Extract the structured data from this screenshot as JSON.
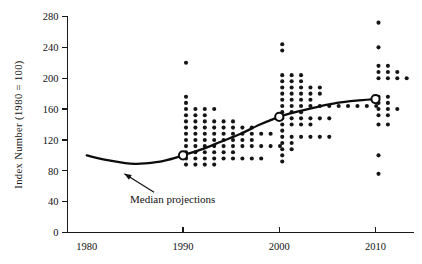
{
  "chart_data": {
    "type": "scatter",
    "title": "",
    "xlabel": "",
    "ylabel": "Index  Number  (1980 = 100)",
    "xlim": [
      1978,
      2014
    ],
    "ylim": [
      0,
      280
    ],
    "xticks": [
      1980,
      1990,
      2000,
      2010
    ],
    "yticks": [
      0,
      40,
      80,
      120,
      160,
      200,
      240,
      280
    ],
    "grid": false,
    "legend": "none",
    "annotations": [
      {
        "text": "Median projections",
        "x": 1984.5,
        "y": 38,
        "arrow_to_x": 1983.6,
        "arrow_to_y": 84
      }
    ],
    "series": [
      {
        "name": "Median projections",
        "type": "line",
        "marker": "open-circle-at-survey-years",
        "x": [
          1980,
          1982,
          1984,
          1985,
          1986,
          1988,
          1990,
          1992,
          1994,
          1996,
          1998,
          2000,
          2002,
          2004,
          2006,
          2008,
          2010
        ],
        "y": [
          100,
          94,
          90,
          89,
          89.5,
          93,
          100,
          108,
          118,
          128,
          140,
          150,
          157,
          163,
          168,
          171,
          173
        ],
        "marker_x": [
          1990,
          2000,
          2010
        ],
        "marker_y": [
          100,
          150,
          173
        ]
      },
      {
        "name": "Individual projections 1990",
        "type": "dotplot",
        "year": 1990,
        "bins": [
          {
            "value": 220,
            "count": 1
          },
          {
            "value": 176,
            "count": 1
          },
          {
            "value": 168,
            "count": 1
          },
          {
            "value": 160,
            "count": 4
          },
          {
            "value": 152,
            "count": 3
          },
          {
            "value": 144,
            "count": 6
          },
          {
            "value": 136,
            "count": 8
          },
          {
            "value": 128,
            "count": 10
          },
          {
            "value": 120,
            "count": 8
          },
          {
            "value": 112,
            "count": 11
          },
          {
            "value": 104,
            "count": 6
          },
          {
            "value": 96,
            "count": 9
          },
          {
            "value": 88,
            "count": 4
          }
        ]
      },
      {
        "name": "Individual projections 2000",
        "type": "dotplot",
        "year": 2000,
        "bins": [
          {
            "value": 244,
            "count": 1
          },
          {
            "value": 236,
            "count": 1
          },
          {
            "value": 204,
            "count": 3
          },
          {
            "value": 196,
            "count": 3
          },
          {
            "value": 188,
            "count": 5
          },
          {
            "value": 180,
            "count": 5
          },
          {
            "value": 172,
            "count": 4
          },
          {
            "value": 164,
            "count": 11
          },
          {
            "value": 156,
            "count": 3
          },
          {
            "value": 148,
            "count": 6
          },
          {
            "value": 140,
            "count": 4
          },
          {
            "value": 132,
            "count": 1
          },
          {
            "value": 124,
            "count": 6
          },
          {
            "value": 116,
            "count": 2
          },
          {
            "value": 108,
            "count": 2
          },
          {
            "value": 100,
            "count": 1
          },
          {
            "value": 92,
            "count": 1
          }
        ]
      },
      {
        "name": "Individual projections 2010",
        "type": "dotplot",
        "year": 2010,
        "bins": [
          {
            "value": 272,
            "count": 1
          },
          {
            "value": 240,
            "count": 1
          },
          {
            "value": 216,
            "count": 2
          },
          {
            "value": 208,
            "count": 3
          },
          {
            "value": 200,
            "count": 4
          },
          {
            "value": 176,
            "count": 2
          },
          {
            "value": 168,
            "count": 2
          },
          {
            "value": 160,
            "count": 3
          },
          {
            "value": 152,
            "count": 2
          },
          {
            "value": 140,
            "count": 2
          },
          {
            "value": 100,
            "count": 1
          },
          {
            "value": 76,
            "count": 1
          }
        ]
      }
    ]
  }
}
